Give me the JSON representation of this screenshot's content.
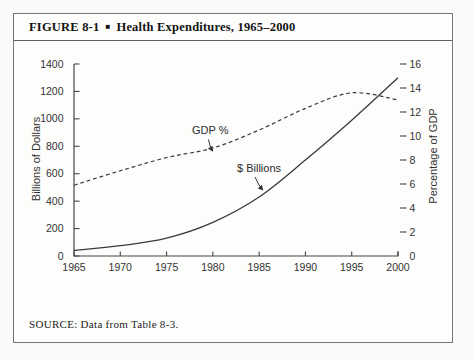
{
  "figure": {
    "label": "FIGURE 8-1",
    "bullet": "■",
    "title": "Health Expenditures, 1965–2000",
    "source": "SOURCE: Data from Table 8-3."
  },
  "chart_data": {
    "type": "line",
    "title": "Health Expenditures, 1965–2000",
    "x": [
      1965,
      1970,
      1975,
      1980,
      1985,
      1990,
      1995,
      2000
    ],
    "series": [
      {
        "name": "$ Billions",
        "axis": "left",
        "style": "solid",
        "values": [
          40,
          75,
          130,
          245,
          430,
          700,
          990,
          1300
        ]
      },
      {
        "name": "GDP %",
        "axis": "right",
        "style": "dashed",
        "values": [
          5.9,
          7.1,
          8.2,
          9.0,
          10.5,
          12.3,
          13.6,
          13.0
        ]
      }
    ],
    "x_axis": {
      "range": [
        1965,
        2000
      ],
      "ticks": [
        1965,
        1970,
        1975,
        1980,
        1985,
        1990,
        1995,
        2000
      ]
    },
    "left_axis": {
      "label": "Billions of Dollars",
      "range": [
        0,
        1400
      ],
      "ticks": [
        0,
        200,
        400,
        600,
        800,
        1000,
        1200,
        1400
      ]
    },
    "right_axis": {
      "label": "Percentage of GDP",
      "range": [
        0,
        16
      ],
      "ticks": [
        0,
        2,
        4,
        6,
        8,
        10,
        12,
        14,
        16
      ]
    },
    "grid": false,
    "legend": "none (inline text annotations with arrows)",
    "annotations": [
      {
        "text": "GDP %",
        "points_to": "dashed line near year 1980"
      },
      {
        "text": "$ Billions",
        "points_to": "solid line near year 1985"
      }
    ]
  }
}
